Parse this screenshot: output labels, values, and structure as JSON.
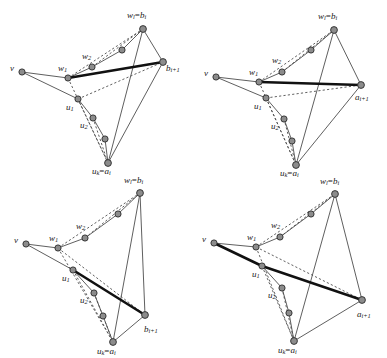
{
  "figure": {
    "type": "diagram",
    "background_color": "#ffffff",
    "node_fill": "#8c8c8c",
    "node_stroke": "#2b2b2b",
    "edge_color": "#4d4d4d",
    "dashed_color": "#4d4d4d",
    "thick_edge_color": "#111111",
    "panels": [
      {
        "id": "top-left",
        "position": "top-left",
        "apex_label": "b_{i+1}",
        "highlight": "w1 to b_{i+1}",
        "labels": {
          "v": "v",
          "w1": "w1",
          "w2": "w2",
          "wl": "wl=bi",
          "u1": "u1",
          "u2": "u2",
          "uk": "uk=ai",
          "apex": "bi+1"
        }
      },
      {
        "id": "top-right",
        "position": "top-right",
        "apex_label": "a_{i+1}",
        "highlight": "w1 to a_{i+1}",
        "labels": {
          "v": "v",
          "w1": "w1",
          "w2": "w2",
          "wl": "wl=bi",
          "u1": "u1",
          "u2": "u2",
          "uk": "uk=ai",
          "apex": "ai+1"
        }
      },
      {
        "id": "bottom-left",
        "position": "bottom-left",
        "apex_label": "b_{i+1}",
        "highlight": "u1 to b_{i+1}",
        "labels": {
          "v": "v",
          "w1": "w1",
          "w2": "w2",
          "wl": "wl=bi",
          "u1": "u1",
          "u2": "u2",
          "uk": "uk=ai",
          "apex": "bi+1"
        }
      },
      {
        "id": "bottom-right",
        "position": "bottom-right",
        "apex_label": "a_{i+1}",
        "highlight": "v through u1 to a_{i+1}",
        "labels": {
          "v": "v",
          "w1": "w1",
          "w2": "w2",
          "wl": "wl=bi",
          "u1": "u1",
          "u2": "u2",
          "uk": "uk=ai",
          "apex": "ai+1"
        }
      }
    ],
    "glyphs": {
      "v": "v",
      "w": "w",
      "u": "u",
      "a": "a",
      "b": "b",
      "l": "l",
      "k": "k",
      "i": "i",
      "one": "1",
      "two": "2",
      "eq": "=",
      "iplus1": "i+1"
    }
  }
}
